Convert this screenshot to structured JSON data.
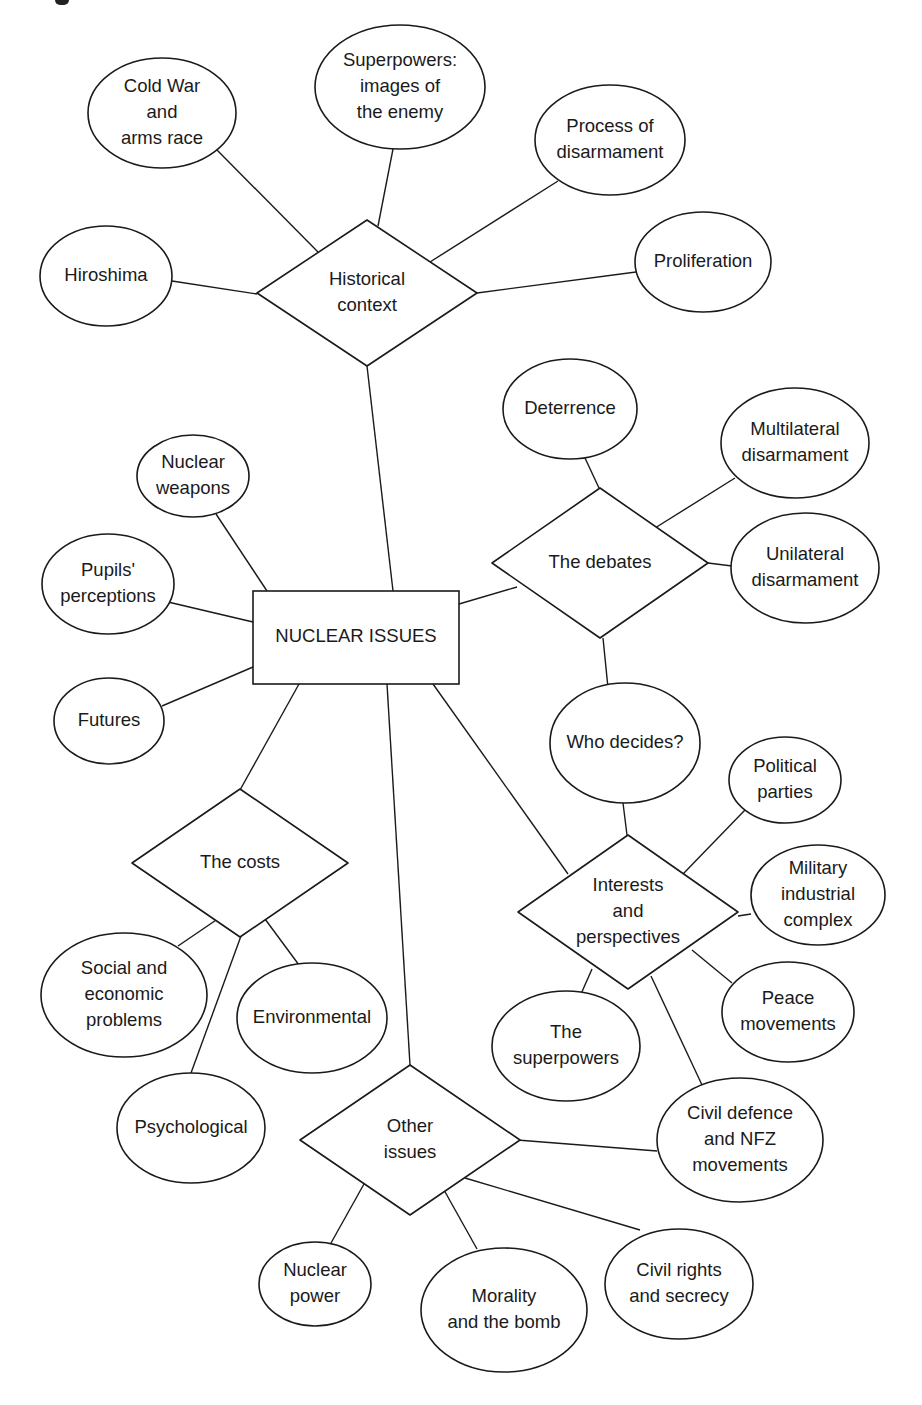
{
  "diagram": {
    "title": "NUCLEAR ISSUES",
    "center": {
      "id": "nuclear-issues",
      "label": [
        "NUCLEAR ISSUES"
      ],
      "shape": "rect",
      "x": 253,
      "y": 591,
      "w": 206,
      "h": 93
    },
    "hubs": [
      {
        "id": "historical-context",
        "label": [
          "Historical",
          "context"
        ],
        "shape": "diamond",
        "cx": 367,
        "cy": 293,
        "hw": 110,
        "hh": 73
      },
      {
        "id": "the-debates",
        "label": [
          "The debates"
        ],
        "shape": "diamond",
        "cx": 600,
        "cy": 563,
        "hw": 108,
        "hh": 75
      },
      {
        "id": "the-costs",
        "label": [
          "The costs"
        ],
        "shape": "diamond",
        "cx": 240,
        "cy": 863,
        "hw": 108,
        "hh": 74
      },
      {
        "id": "interests-and-perspectives",
        "label": [
          "Interests",
          "and",
          "perspectives"
        ],
        "shape": "diamond",
        "cx": 628,
        "cy": 912,
        "hw": 110,
        "hh": 77
      },
      {
        "id": "other-issues",
        "label": [
          "Other",
          "issues"
        ],
        "shape": "diamond",
        "cx": 410,
        "cy": 1140,
        "hw": 110,
        "hh": 75
      }
    ],
    "leaves": [
      {
        "id": "cold-war",
        "parent": "historical-context",
        "label": [
          "Cold War",
          "and",
          "arms race"
        ],
        "cx": 162,
        "cy": 113,
        "rx": 74,
        "ry": 55
      },
      {
        "id": "superpowers-images",
        "parent": "historical-context",
        "label": [
          "Superpowers:",
          "images of",
          "the enemy"
        ],
        "cx": 400,
        "cy": 87,
        "rx": 85,
        "ry": 62
      },
      {
        "id": "process-of-disarmament",
        "parent": "historical-context",
        "label": [
          "Process of",
          "disarmament"
        ],
        "cx": 610,
        "cy": 140,
        "rx": 75,
        "ry": 55
      },
      {
        "id": "hiroshima",
        "parent": "historical-context",
        "label": [
          "Hiroshima"
        ],
        "cx": 106,
        "cy": 276,
        "rx": 66,
        "ry": 50
      },
      {
        "id": "proliferation",
        "parent": "historical-context",
        "label": [
          "Proliferation"
        ],
        "cx": 703,
        "cy": 262,
        "rx": 68,
        "ry": 50
      },
      {
        "id": "deterrence",
        "parent": "the-debates",
        "label": [
          "Deterrence"
        ],
        "cx": 570,
        "cy": 409,
        "rx": 67,
        "ry": 50
      },
      {
        "id": "multilateral-disarmament",
        "parent": "the-debates",
        "label": [
          "Multilateral",
          "disarmament"
        ],
        "cx": 795,
        "cy": 443,
        "rx": 74,
        "ry": 55
      },
      {
        "id": "unilateral-disarmament",
        "parent": "the-debates",
        "label": [
          "Unilateral",
          "disarmament"
        ],
        "cx": 805,
        "cy": 568,
        "rx": 74,
        "ry": 55
      },
      {
        "id": "nuclear-weapons",
        "parent": "nuclear-issues",
        "label": [
          "Nuclear",
          "weapons"
        ],
        "cx": 193,
        "cy": 476,
        "rx": 56,
        "ry": 41
      },
      {
        "id": "pupils-perceptions",
        "parent": "nuclear-issues",
        "label": [
          "Pupils'",
          "perceptions"
        ],
        "cx": 108,
        "cy": 584,
        "rx": 66,
        "ry": 50
      },
      {
        "id": "futures",
        "parent": "nuclear-issues",
        "label": [
          "Futures"
        ],
        "cx": 109,
        "cy": 721,
        "rx": 55,
        "ry": 43
      },
      {
        "id": "who-decides",
        "parent": "the-debates",
        "label": [
          "Who decides?"
        ],
        "cx": 625,
        "cy": 743,
        "rx": 75,
        "ry": 60
      },
      {
        "id": "political-parties",
        "parent": "interests-and-perspectives",
        "label": [
          "Political",
          "parties"
        ],
        "cx": 785,
        "cy": 780,
        "rx": 56,
        "ry": 43
      },
      {
        "id": "military-industrial-complex",
        "parent": "interests-and-perspectives",
        "label": [
          "Military",
          "industrial",
          "complex"
        ],
        "cx": 818,
        "cy": 895,
        "rx": 67,
        "ry": 50
      },
      {
        "id": "peace-movements",
        "parent": "interests-and-perspectives",
        "label": [
          "Peace",
          "movements"
        ],
        "cx": 788,
        "cy": 1012,
        "rx": 66,
        "ry": 50
      },
      {
        "id": "the-superpowers",
        "parent": "interests-and-perspectives",
        "label": [
          "The",
          "superpowers"
        ],
        "cx": 566,
        "cy": 1046,
        "rx": 74,
        "ry": 55
      },
      {
        "id": "civil-defence-nfz",
        "parent": "other-issues",
        "label": [
          "Civil defence",
          "and NFZ",
          "movements"
        ],
        "cx": 740,
        "cy": 1140,
        "rx": 83,
        "ry": 62
      },
      {
        "id": "social-economic-problems",
        "parent": "the-costs",
        "label": [
          "Social and",
          "economic",
          "problems"
        ],
        "cx": 124,
        "cy": 995,
        "rx": 83,
        "ry": 62
      },
      {
        "id": "environmental",
        "parent": "the-costs",
        "label": [
          "Environmental"
        ],
        "cx": 312,
        "cy": 1018,
        "rx": 75,
        "ry": 55
      },
      {
        "id": "psychological",
        "parent": "the-costs",
        "label": [
          "Psychological"
        ],
        "cx": 191,
        "cy": 1128,
        "rx": 74,
        "ry": 55
      },
      {
        "id": "nuclear-power",
        "parent": "other-issues",
        "label": [
          "Nuclear",
          "power"
        ],
        "cx": 315,
        "cy": 1284,
        "rx": 56,
        "ry": 42
      },
      {
        "id": "morality-and-the-bomb",
        "parent": "other-issues",
        "label": [
          "Morality",
          "and the bomb"
        ],
        "cx": 504,
        "cy": 1310,
        "rx": 83,
        "ry": 62
      },
      {
        "id": "civil-rights-secrecy",
        "parent": "other-issues",
        "label": [
          "Civil rights",
          "and secrecy"
        ],
        "cx": 679,
        "cy": 1284,
        "rx": 74,
        "ry": 55
      }
    ],
    "edges": [
      [
        217,
        150,
        318,
        252
      ],
      [
        393,
        149,
        378,
        226
      ],
      [
        558,
        181,
        430,
        262
      ],
      [
        172,
        281,
        257,
        294
      ],
      [
        636,
        272,
        477,
        293
      ],
      [
        367,
        366,
        393,
        591
      ],
      [
        585,
        458,
        599,
        488
      ],
      [
        735,
        478,
        655,
        528
      ],
      [
        732,
        566,
        708,
        563
      ],
      [
        459,
        604,
        517,
        587
      ],
      [
        216,
        514,
        267,
        591
      ],
      [
        168,
        602,
        253,
        622
      ],
      [
        162,
        706,
        253,
        667
      ],
      [
        603,
        638,
        608,
        688
      ],
      [
        299,
        684,
        240,
        790
      ],
      [
        225,
        914,
        178,
        946
      ],
      [
        265,
        919,
        299,
        965
      ],
      [
        241,
        936,
        191,
        1073
      ],
      [
        623,
        803,
        627,
        835
      ],
      [
        745,
        810,
        683,
        874
      ],
      [
        751,
        914,
        738,
        916
      ],
      [
        692,
        950,
        732,
        983
      ],
      [
        592,
        969,
        581,
        994
      ],
      [
        651,
        976,
        702,
        1085
      ],
      [
        433,
        684,
        568,
        874
      ],
      [
        387,
        684,
        410,
        1065
      ],
      [
        517,
        1140,
        657,
        1151
      ],
      [
        465,
        1178,
        640,
        1230
      ],
      [
        364,
        1184,
        331,
        1243
      ],
      [
        444,
        1190,
        477,
        1249
      ]
    ]
  }
}
